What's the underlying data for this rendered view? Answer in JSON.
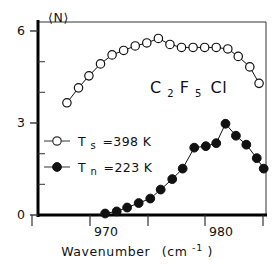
{
  "chart_data": {
    "type": "scatter",
    "title": "",
    "xlabel": "Wavenumber",
    "xlabel_units": "(cm",
    "xlabel_units_exp": "-1",
    "xlabel_units_close": ")",
    "ylabel": "⟨N⟩",
    "xlim": [
      964.0,
      983.7
    ],
    "ylim": [
      0,
      6.45
    ],
    "xticks_major": [
      970,
      980
    ],
    "xticks_major_labels": [
      "970",
      "980"
    ],
    "xticks_minor": [
      965,
      975,
      985
    ],
    "yticks_major": [
      0,
      3,
      6
    ],
    "yticks_major_labels": [
      "0",
      "3",
      "6"
    ],
    "yticks_minor": [
      1,
      2,
      4,
      5
    ],
    "grid": false,
    "legend_position": "center-left",
    "annotation": "C2F5Cl",
    "series": [
      {
        "name": "Ts =398 K",
        "marker": "open-circle",
        "color": "#111111",
        "points": [
          {
            "x": 966.5,
            "y": 3.75
          },
          {
            "x": 967.5,
            "y": 4.25
          },
          {
            "x": 968.4,
            "y": 4.65
          },
          {
            "x": 969.4,
            "y": 5.05
          },
          {
            "x": 970.4,
            "y": 5.35
          },
          {
            "x": 971.4,
            "y": 5.5
          },
          {
            "x": 972.4,
            "y": 5.65
          },
          {
            "x": 973.4,
            "y": 5.75
          },
          {
            "x": 974.4,
            "y": 5.9
          },
          {
            "x": 975.4,
            "y": 5.7
          },
          {
            "x": 976.4,
            "y": 5.6
          },
          {
            "x": 977.4,
            "y": 5.6
          },
          {
            "x": 978.4,
            "y": 5.6
          },
          {
            "x": 979.4,
            "y": 5.6
          },
          {
            "x": 980.4,
            "y": 5.55
          },
          {
            "x": 981.3,
            "y": 5.3
          },
          {
            "x": 982.3,
            "y": 4.95
          },
          {
            "x": 983.1,
            "y": 4.4
          }
        ]
      },
      {
        "name": "Tn =223 K",
        "marker": "filled-circle",
        "color": "#111111",
        "points": [
          {
            "x": 969.8,
            "y": 0.05
          },
          {
            "x": 970.8,
            "y": 0.12
          },
          {
            "x": 971.7,
            "y": 0.25
          },
          {
            "x": 972.7,
            "y": 0.4
          },
          {
            "x": 973.7,
            "y": 0.55
          },
          {
            "x": 974.6,
            "y": 0.85
          },
          {
            "x": 975.6,
            "y": 1.2
          },
          {
            "x": 976.5,
            "y": 1.55
          },
          {
            "x": 977.5,
            "y": 2.25
          },
          {
            "x": 978.5,
            "y": 2.3
          },
          {
            "x": 979.4,
            "y": 2.4
          },
          {
            "x": 980.2,
            "y": 3.05
          },
          {
            "x": 981.1,
            "y": 2.65
          },
          {
            "x": 982.0,
            "y": 2.35
          },
          {
            "x": 982.9,
            "y": 1.9
          },
          {
            "x": 983.5,
            "y": 1.55
          }
        ]
      }
    ]
  },
  "annotation": {
    "formula_c": "C",
    "formula_2": "2",
    "formula_f": "F",
    "formula_5": "5",
    "formula_cl": "Cl"
  },
  "legend": [
    {
      "symbol": "open-circle",
      "text": "T",
      "sub": "s",
      "value": "=398  K"
    },
    {
      "symbol": "filled-circle",
      "text": "T",
      "sub": "n",
      "value": "=223  K"
    }
  ],
  "axes": {
    "y_axis_title": "⟨N⟩",
    "x_axis_title": "Wavenumber",
    "x_axis_unit_open": "(cm",
    "x_axis_unit_exp": "-1",
    "x_axis_unit_close": ")",
    "ytick_0": "0",
    "ytick_3": "3",
    "ytick_6": "6",
    "xtick_970": "970",
    "xtick_980": "980"
  }
}
